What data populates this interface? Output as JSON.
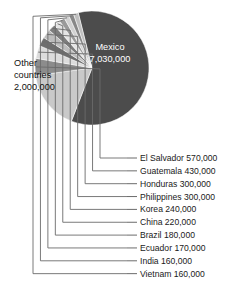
{
  "chart_data": {
    "type": "pie",
    "title": "",
    "subtitle": "",
    "xlabel": "",
    "ylabel": "",
    "legend_position": "right",
    "grid": false,
    "value_unit": "people",
    "categories": [
      "Mexico",
      "Other countries",
      "El Salvador",
      "Guatemala",
      "Honduras",
      "Philippines",
      "Korea",
      "China",
      "Brazil",
      "Ecuador",
      "India",
      "Vietnam"
    ],
    "values": [
      7030000,
      2000000,
      570000,
      430000,
      300000,
      300000,
      240000,
      220000,
      180000,
      170000,
      160000,
      160000
    ],
    "value_labels": [
      "7,030,000",
      "2,000,000",
      "570,000",
      "430,000",
      "300,000",
      "300,000",
      "240,000",
      "220,000",
      "180,000",
      "170,000",
      "160,000",
      "160,000"
    ],
    "slice_colors": [
      "#4c4c4c",
      "#c9c9c9",
      "#8c8c8c",
      "#dcdcdc",
      "#6e6e6e",
      "#bdbdbd",
      "#7e7e7e",
      "#e4e4e4",
      "#9a9a9a",
      "#d2d2d2",
      "#888888",
      "#bfbfbf"
    ]
  },
  "pie_labels": [
    {
      "name": "mexico",
      "line1": "Mexico",
      "line2": "7,030,000",
      "x": 110,
      "y1": 50,
      "y2": 62,
      "tone": "light",
      "anchor": "middle"
    },
    {
      "name": "other-countries",
      "line1": "Other",
      "line2": "countries",
      "line3": "2,000,000",
      "x": 14,
      "y1": 66,
      "y2": 78,
      "y3": 90,
      "tone": "dark",
      "anchor": "start"
    }
  ],
  "legend": {
    "items": [
      {
        "label": "El Salvador 570,000",
        "name": "legend-el-salvador"
      },
      {
        "label": "Guatemala 430,000",
        "name": "legend-guatemala"
      },
      {
        "label": "Honduras 300,000",
        "name": "legend-honduras"
      },
      {
        "label": "Philippines 300,000",
        "name": "legend-philippines"
      },
      {
        "label": "Korea 240,000",
        "name": "legend-korea"
      },
      {
        "label": "China 220,000",
        "name": "legend-china"
      },
      {
        "label": "Brazil 180,000",
        "name": "legend-brazil"
      },
      {
        "label": "Ecuador 170,000",
        "name": "legend-ecuador"
      },
      {
        "label": "India 160,000",
        "name": "legend-india"
      },
      {
        "label": "Vietnam 160,000",
        "name": "legend-vietnam"
      }
    ]
  },
  "colors": {
    "background": "#ffffff",
    "leader_line": "#6b6b6b",
    "text": "#1a1a1a",
    "mexico_slice": "#4c4c4c",
    "other_slice": "#c9c9c9"
  }
}
